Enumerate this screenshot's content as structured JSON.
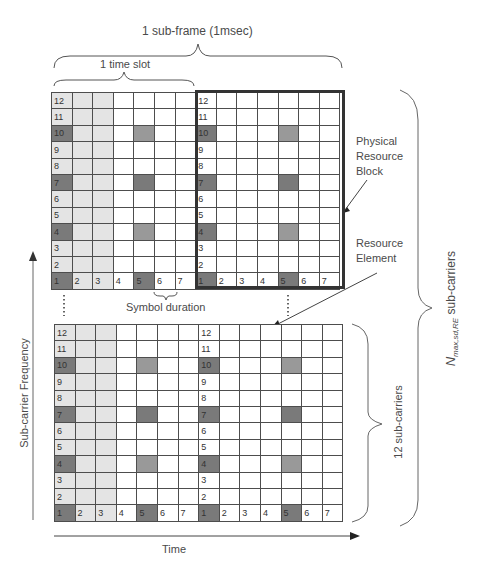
{
  "labels": {
    "subframe": "1 sub-frame (1msec)",
    "timeslot": "1 time slot",
    "prb": [
      "Physical",
      "Resource",
      "Block"
    ],
    "re": [
      "Resource",
      "Element"
    ],
    "symbol_duration": "Symbol duration",
    "y_axis": "Sub-carrier Frequency",
    "x_axis": "Time",
    "twelve_subcarriers": "12 sub-carriers",
    "n_max_main": "N",
    "n_max_sub": "max,sd,RE",
    "n_max_suffix": " sub-carriers",
    "ellipsis": "⋮"
  },
  "grid": {
    "rows": 12,
    "slots": 2,
    "symbols_per_slot": 7,
    "row_labels": [
      "12",
      "11",
      "10",
      "9",
      "8",
      "7",
      "6",
      "5",
      "4",
      "3",
      "2",
      "1"
    ],
    "bottom_row_labels": [
      "1",
      "2",
      "3",
      "4",
      "5",
      "6",
      "7",
      "1",
      "2",
      "3",
      "4",
      "5",
      "6",
      "7"
    ],
    "reference_signal_rows": [
      "10",
      "7",
      "4",
      "1"
    ],
    "reference_signal_symbol": "5",
    "control_region_symbols": [
      "1",
      "2",
      "3"
    ],
    "colors": {
      "control_light": "#e4e4e4",
      "reference_dark": "#7a7a7a",
      "reference_mid": "#999999",
      "data_white": "#ffffff",
      "grid_line": "#4d4d4d",
      "prb_border": "#333333"
    }
  }
}
